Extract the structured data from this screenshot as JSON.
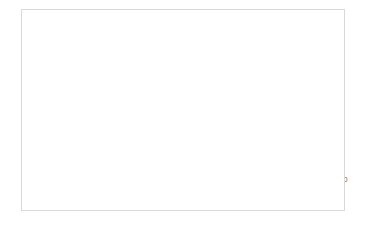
{
  "chart_data": {
    "type": "line",
    "title": "",
    "xlabel": "Number of Iterations",
    "ylabel": "Error",
    "xlim": [
      0,
      18000
    ],
    "ylim": [
      0,
      1.2
    ],
    "xticks": [
      0,
      2000,
      4000,
      6000,
      8000,
      10000,
      12000,
      14000,
      16000,
      18000
    ],
    "xtick_labels": [
      "0",
      "2000",
      "4000",
      "6000",
      "8000",
      "10000",
      "12000",
      "14000",
      "16000",
      "18000"
    ],
    "yticks": [
      0,
      0.2,
      0.4,
      0.6,
      0.8,
      1,
      1.2
    ],
    "ytick_labels": [
      "0",
      "0.2",
      "0.4",
      "0.6",
      "0.8",
      "1",
      "1.2"
    ],
    "grid": true,
    "legend": false,
    "legend_position": "none",
    "series": [
      {
        "name": "Error",
        "color": "#7f7f7f",
        "marker": "circle",
        "x": [
          100,
          300,
          400,
          500,
          600,
          700,
          750,
          800,
          900,
          1000,
          1100,
          2000,
          3000,
          4000,
          5000,
          6000,
          7000,
          8000,
          9000,
          10000,
          11000,
          12000,
          13000,
          14000,
          15000,
          16000,
          17000
        ],
        "y": [
          1.08,
          0.75,
          0.77,
          0.72,
          0.6,
          0.57,
          0.53,
          0.52,
          0.51,
          0.43,
          0.39,
          0.255,
          0.25,
          0.19,
          0.157,
          0.143,
          0.158,
          0.152,
          0.159,
          0.168,
          0.105,
          0.09,
          0.11,
          0.121,
          0.13,
          0.09,
          0.112
        ]
      }
    ]
  },
  "style": {
    "line_color": "#7f7f7f",
    "marker_color": "#6e6e6e",
    "grid_color": "#d6d6d6",
    "frame_color": "#d9d9d9",
    "axis_color": "#9a9a9a",
    "text_color": "#5a5a5a",
    "background": "#ffffff"
  }
}
